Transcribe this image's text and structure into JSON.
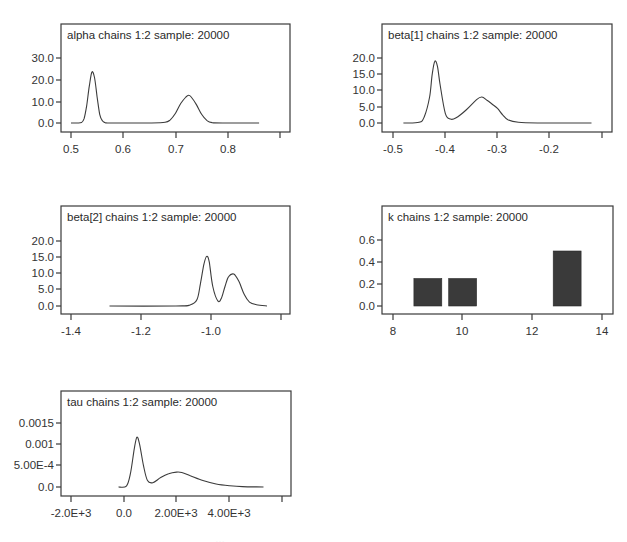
{
  "figure": {
    "panels": [
      {
        "id": "alpha",
        "title": "alpha chains 1:2 sample: 20000",
        "frame": {
          "x": 61,
          "y": 24,
          "w": 229,
          "h": 108
        },
        "xaxis": {
          "y": 141,
          "ticks": [
            {
              "v": 0.5,
              "px": 71,
              "label": "0.5"
            },
            {
              "v": 0.6,
              "px": 123,
              "label": "0.6"
            },
            {
              "v": 0.7,
              "px": 176,
              "label": "0.7"
            },
            {
              "v": 0.8,
              "px": 228,
              "label": "0.8"
            },
            {
              "v": 0.9,
              "px": 280,
              "label": ""
            }
          ]
        },
        "yaxis": {
          "x": 61,
          "ticks": [
            {
              "v": 30.0,
              "px": 58,
              "label": "30.0"
            },
            {
              "v": 20.0,
              "px": 80,
              "label": "20.0"
            },
            {
              "v": 10.0,
              "px": 102,
              "label": "10.0"
            },
            {
              "v": 0.0,
              "px": 123,
              "label": "0.0"
            }
          ]
        },
        "x_range": [
          0.5,
          0.9
        ],
        "y_range": [
          0.0,
          30.0
        ]
      },
      {
        "id": "beta1",
        "title": "beta[1] chains 1:2 sample: 20000",
        "frame": {
          "x": 382,
          "y": 24,
          "w": 230,
          "h": 108
        },
        "xaxis": {
          "y": 141,
          "ticks": [
            {
              "v": -0.5,
              "px": 393,
              "label": "-0.5"
            },
            {
              "v": -0.4,
              "px": 445,
              "label": "-0.4"
            },
            {
              "v": -0.3,
              "px": 497,
              "label": "-0.3"
            },
            {
              "v": -0.2,
              "px": 549,
              "label": "-0.2"
            },
            {
              "v": -0.1,
              "px": 602,
              "label": ""
            }
          ]
        },
        "yaxis": {
          "x": 382,
          "ticks": [
            {
              "v": 20.0,
              "px": 58,
              "label": "20.0"
            },
            {
              "v": 15.0,
              "px": 74,
              "label": "15.0"
            },
            {
              "v": 10.0,
              "px": 90,
              "label": "10.0"
            },
            {
              "v": 5.0,
              "px": 107,
              "label": "5.0"
            },
            {
              "v": 0.0,
              "px": 123,
              "label": "0.0"
            }
          ]
        },
        "x_range": [
          -0.5,
          -0.1
        ],
        "y_range": [
          0.0,
          20.0
        ]
      },
      {
        "id": "beta2",
        "title": "beta[2] chains 1:2 sample: 20000",
        "frame": {
          "x": 61,
          "y": 206,
          "w": 229,
          "h": 108
        },
        "xaxis": {
          "y": 323,
          "ticks": [
            {
              "v": -1.4,
              "px": 71,
              "label": "-1.4"
            },
            {
              "v": -1.2,
              "px": 141,
              "label": "-1.2"
            },
            {
              "v": -1.0,
              "px": 211,
              "label": "-1.0"
            },
            {
              "v": -0.8,
              "px": 281,
              "label": ""
            }
          ]
        },
        "yaxis": {
          "x": 61,
          "ticks": [
            {
              "v": 20.0,
              "px": 241,
              "label": "20.0"
            },
            {
              "v": 15.0,
              "px": 257,
              "label": "15.0"
            },
            {
              "v": 10.0,
              "px": 273,
              "label": "10.0"
            },
            {
              "v": 5.0,
              "px": 289,
              "label": "5.0"
            },
            {
              "v": 0.0,
              "px": 306,
              "label": "0.0"
            }
          ]
        },
        "x_range": [
          -1.4,
          -0.8
        ],
        "y_range": [
          0.0,
          20.0
        ]
      },
      {
        "id": "k",
        "title": "k chains 1:2 sample: 20000",
        "frame": {
          "x": 382,
          "y": 206,
          "w": 231,
          "h": 108
        },
        "xaxis": {
          "y": 323,
          "ticks": [
            {
              "v": 8,
              "px": 393,
              "label": "8"
            },
            {
              "v": 10,
              "px": 462,
              "label": "10"
            },
            {
              "v": 12,
              "px": 532,
              "label": "12"
            },
            {
              "v": 14,
              "px": 602,
              "label": "14"
            }
          ]
        },
        "yaxis": {
          "x": 382,
          "ticks": [
            {
              "v": 0.6,
              "px": 240,
              "label": "0.6"
            },
            {
              "v": 0.4,
              "px": 262,
              "label": "0.4"
            },
            {
              "v": 0.2,
              "px": 284,
              "label": "0.2"
            },
            {
              "v": 0.0,
              "px": 306,
              "label": "0.0"
            }
          ]
        },
        "x_range": [
          8,
          14
        ],
        "y_range": [
          0.0,
          0.6
        ]
      },
      {
        "id": "tau",
        "title": "tau chains 1:2 sample: 20000",
        "frame": {
          "x": 61,
          "y": 391,
          "w": 230,
          "h": 105
        },
        "xaxis": {
          "y": 505,
          "ticks": [
            {
              "v": -2000,
              "px": 71,
              "label": "-2.0E+3"
            },
            {
              "v": 0,
              "px": 124,
              "label": "0.0"
            },
            {
              "v": 2000,
              "px": 176,
              "label": "2.00E+3"
            },
            {
              "v": 4000,
              "px": 229,
              "label": "4.00E+3"
            },
            {
              "v": 6000,
              "px": 282,
              "label": ""
            }
          ]
        },
        "yaxis": {
          "x": 61,
          "ticks": [
            {
              "v": 0.0015,
              "px": 423,
              "label": "0.0015"
            },
            {
              "v": 0.001,
              "px": 444,
              "label": "0.001"
            },
            {
              "v": 0.0005,
              "px": 465,
              "label": "5.00E-4"
            },
            {
              "v": 0.0,
              "px": 487,
              "label": "0.0"
            }
          ]
        },
        "x_range": [
          -2000,
          6000
        ],
        "y_range": [
          0.0,
          0.0015
        ]
      }
    ]
  },
  "chart_data": [
    {
      "type": "line",
      "title": "alpha chains 1:2 sample: 20000",
      "xlabel": "",
      "ylabel": "",
      "xlim": [
        0.5,
        0.9
      ],
      "ylim": [
        0.0,
        30.0
      ],
      "x_ticks": [
        "0.5",
        "0.6",
        "0.7",
        "0.8"
      ],
      "y_ticks": [
        "0.0",
        "10.0",
        "20.0",
        "30.0"
      ],
      "grid": false,
      "x": [
        0.5,
        0.51,
        0.52,
        0.525,
        0.53,
        0.535,
        0.54,
        0.545,
        0.55,
        0.555,
        0.56,
        0.565,
        0.57,
        0.6,
        0.65,
        0.68,
        0.69,
        0.7,
        0.71,
        0.72,
        0.725,
        0.73,
        0.74,
        0.75,
        0.76,
        0.77,
        0.8,
        0.86
      ],
      "values": [
        0,
        0,
        0.2,
        2,
        8,
        17,
        23.5,
        21,
        12,
        4,
        1,
        0.2,
        0,
        0,
        0,
        0.3,
        1.5,
        4.5,
        9,
        12,
        12.8,
        12,
        8.5,
        4,
        1.2,
        0.2,
        0,
        0
      ]
    },
    {
      "type": "line",
      "title": "beta[1] chains 1:2 sample: 20000",
      "xlabel": "",
      "ylabel": "",
      "xlim": [
        -0.5,
        -0.1
      ],
      "ylim": [
        0.0,
        20.0
      ],
      "x_ticks": [
        "-0.5",
        "-0.4",
        "-0.3",
        "-0.2"
      ],
      "y_ticks": [
        "0.0",
        "5.0",
        "10.0",
        "15.0",
        "20.0"
      ],
      "grid": false,
      "x": [
        -0.48,
        -0.45,
        -0.44,
        -0.43,
        -0.425,
        -0.42,
        -0.415,
        -0.41,
        -0.4,
        -0.39,
        -0.38,
        -0.36,
        -0.34,
        -0.33,
        -0.32,
        -0.31,
        -0.3,
        -0.29,
        -0.28,
        -0.26,
        -0.22,
        -0.12
      ],
      "values": [
        0,
        0.2,
        2,
        8,
        15,
        19,
        17.5,
        12,
        3,
        1.2,
        1.5,
        4,
        7.2,
        8,
        7,
        5.8,
        4.5,
        2.5,
        1,
        0.2,
        0,
        0
      ]
    },
    {
      "type": "line",
      "title": "beta[2] chains 1:2 sample: 20000",
      "xlabel": "",
      "ylabel": "",
      "xlim": [
        -1.4,
        -0.8
      ],
      "ylim": [
        0.0,
        20.0
      ],
      "x_ticks": [
        "-1.4",
        "-1.2",
        "-1.0"
      ],
      "y_ticks": [
        "0.0",
        "5.0",
        "10.0",
        "15.0",
        "20.0"
      ],
      "grid": false,
      "x": [
        -1.29,
        -1.1,
        -1.06,
        -1.04,
        -1.03,
        -1.02,
        -1.012,
        -1.005,
        -0.995,
        -0.98,
        -0.97,
        -0.96,
        -0.95,
        -0.935,
        -0.92,
        -0.905,
        -0.89,
        -0.87,
        -0.84
      ],
      "values": [
        0,
        0,
        0.3,
        2,
        7,
        13,
        15.3,
        13.5,
        6,
        1.5,
        2.5,
        6,
        9,
        9.8,
        7.5,
        3.5,
        1.2,
        0.4,
        0
      ]
    },
    {
      "type": "bar",
      "title": "k chains 1:2 sample: 20000",
      "xlabel": "",
      "ylabel": "",
      "xlim": [
        8,
        14
      ],
      "ylim": [
        0.0,
        0.6
      ],
      "x_ticks": [
        "8",
        "10",
        "12",
        "14"
      ],
      "y_ticks": [
        "0.0",
        "0.2",
        "0.4",
        "0.6"
      ],
      "grid": false,
      "categories": [
        9,
        10,
        13
      ],
      "values": [
        0.25,
        0.25,
        0.5
      ]
    },
    {
      "type": "line",
      "title": "tau chains 1:2 sample: 20000",
      "xlabel": "",
      "ylabel": "",
      "xlim": [
        -2000,
        6000
      ],
      "ylim": [
        0.0,
        0.0015
      ],
      "x_ticks": [
        "-2.0E+3",
        "0.0",
        "2.00E+3",
        "4.00E+3"
      ],
      "y_ticks": [
        "0.0",
        "5.00E-4",
        "0.001",
        "0.0015"
      ],
      "grid": false,
      "x": [
        -200,
        100,
        250,
        400,
        500,
        600,
        750,
        900,
        1100,
        1400,
        1700,
        2000,
        2200,
        2500,
        3000,
        3500,
        4000,
        4500,
        5300
      ],
      "values": [
        0,
        2e-05,
        0.0003,
        0.0009,
        0.00117,
        0.001,
        0.0005,
        0.00015,
        0.0001,
        0.00022,
        0.00031,
        0.00035,
        0.00034,
        0.00027,
        0.00015,
        7e-05,
        3e-05,
        1e-05,
        0
      ]
    }
  ],
  "footer": {
    "caption_fragment": "…"
  }
}
